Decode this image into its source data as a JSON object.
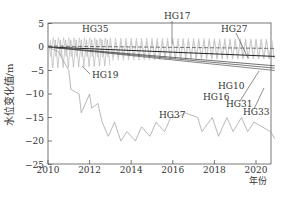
{
  "chart_data": {
    "type": "line",
    "title": "",
    "xlabel": "年份",
    "ylabel": "水位变化值/m",
    "xlim": [
      2010,
      2021
    ],
    "ylim": [
      -25,
      5
    ],
    "x_ticks": [
      "2010",
      "2012",
      "2014",
      "2016",
      "2018",
      "2020"
    ],
    "y_ticks": [
      "5",
      "0",
      "-5",
      "-10",
      "-15",
      "-20",
      "-25"
    ],
    "grid": false,
    "legend": "inline labels",
    "series": [
      {
        "name": "HG35",
        "pattern": "seasonal oscillation",
        "x": [
          2010,
          2021
        ],
        "range": [
          -2,
          2
        ]
      },
      {
        "name": "HG17",
        "pattern": "seasonal oscillation",
        "x": [
          2010,
          2021
        ],
        "range": [
          -1,
          2
        ]
      },
      {
        "name": "HG27",
        "pattern": "seasonal oscillation",
        "x": [
          2010,
          2021
        ],
        "range": [
          -3,
          1.5
        ]
      },
      {
        "name": "HG19",
        "pattern": "seasonal oscillation with downward envelope",
        "x": [
          2010,
          2013
        ],
        "range": [
          -5,
          0
        ]
      },
      {
        "name": "HG10",
        "x": [
          2010,
          2021
        ],
        "values": [
          0,
          -2
        ]
      },
      {
        "name": "HG16",
        "x": [
          2010,
          2021
        ],
        "values": [
          0,
          -4
        ]
      },
      {
        "name": "HG31",
        "x": [
          2010,
          2021
        ],
        "values": [
          0,
          -4.5
        ]
      },
      {
        "name": "HG33",
        "x": [
          2010,
          2021
        ],
        "values": [
          0,
          -5
        ]
      },
      {
        "name": "HG37",
        "x": [
          2010,
          2010.5,
          2011.0,
          2011.1,
          2011.5,
          2011.6,
          2012.0,
          2012.1,
          2012.4,
          2012.6,
          2012.9,
          2013.2,
          2013.5,
          2013.8,
          2014.2,
          2014.5,
          2014.9,
          2015.2,
          2015.6,
          2015.9,
          2016.2,
          2016.6,
          2017.2,
          2017.4,
          2017.9,
          2018.2,
          2018.6,
          2018.9,
          2019.3,
          2019.6,
          2019.9,
          2020.3,
          2020.7,
          2020.9
        ],
        "values": [
          0,
          -1,
          -5,
          -9,
          -10,
          -14,
          -10,
          -13,
          -12,
          -16,
          -19,
          -16,
          -20,
          -18,
          -20,
          -17,
          -19,
          -16,
          -18,
          -15,
          -15,
          -14,
          -15,
          -18,
          -15,
          -19,
          -15,
          -18,
          -15,
          -18,
          -16,
          -17,
          -18,
          -19.5
        ]
      }
    ]
  },
  "labels": {
    "ylabel": "水位变化值/m",
    "xlabel": "年份",
    "series_labels": {
      "HG35": "HG35",
      "HG17": "HG17",
      "HG27": "HG27",
      "HG19": "HG19",
      "HG10": "HG10",
      "HG16": "HG16",
      "HG31": "HG31",
      "HG33": "HG33",
      "HG37": "HG37"
    }
  },
  "colors": {
    "axis": "#333333",
    "line_dark": "#333333",
    "line_light": "#9a9a9a"
  }
}
